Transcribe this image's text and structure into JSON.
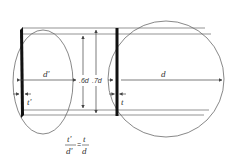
{
  "diagram": {
    "left_shape": {
      "type": "ellipse",
      "diameter_label": "d'",
      "thickness_label": "t'"
    },
    "right_shape": {
      "type": "circle",
      "diameter_label": "d",
      "thickness_label": "t"
    },
    "middle_dimensions": [
      ".6d",
      ".7d"
    ],
    "formula": {
      "left_numerator": "t'",
      "left_denominator": "d'",
      "equals": "=",
      "right_numerator": "t",
      "right_denominator": "d"
    },
    "colors": {
      "line": "#555555",
      "bar": "#111111",
      "background": "#ffffff"
    }
  }
}
